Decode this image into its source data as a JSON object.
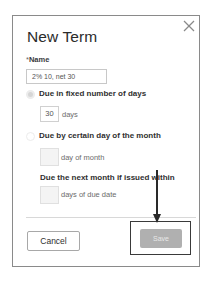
{
  "dialog": {
    "title": "New Term",
    "close_icon": "close-icon"
  },
  "form": {
    "name_required_marker": "*",
    "name_label": "Name",
    "name_value": "2% 10, net 30",
    "options": [
      {
        "label": "Due in fixed number of days",
        "selected": true,
        "input_value": "30",
        "unit": "days"
      },
      {
        "label": "Due by certain day of the month",
        "selected": false,
        "input_value": "",
        "unit": "day of month"
      }
    ],
    "next_month_label": "Due the next month if issued within",
    "next_month_value": "",
    "next_month_unit": "days of due date"
  },
  "footer": {
    "cancel_label": "Cancel",
    "save_label": "Save"
  },
  "annotation": {
    "arrow": "arrow-down-icon",
    "highlight_target": "save-button"
  }
}
